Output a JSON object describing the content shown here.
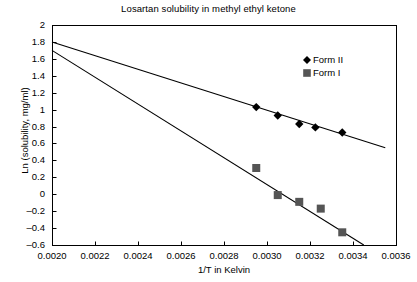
{
  "chart_data": {
    "type": "scatter",
    "title": "Losartan solubility in methyl ethyl ketone",
    "xlabel": "1/T in Kelvin",
    "ylabel": "Ln (solubility, mg/ml)",
    "xlim": [
      0.002,
      0.0036
    ],
    "ylim": [
      -0.6,
      2.0
    ],
    "xticks": [
      "0.0020",
      "0.0022",
      "0.0024",
      "0.0026",
      "0.0028",
      "0.0030",
      "0.0032",
      "0.0034",
      "0.0036"
    ],
    "xtick_values": [
      0.002,
      0.0022,
      0.0024,
      0.0026,
      0.0028,
      0.003,
      0.0032,
      0.0034,
      0.0036
    ],
    "yticks": [
      "2",
      "1.8",
      "1.6",
      "1.4",
      "1.2",
      "1",
      "0.8",
      "0.6",
      "0.4",
      "0.2",
      "0",
      "–0.2",
      "–0.4",
      "–0.6"
    ],
    "ytick_values": [
      2,
      1.8,
      1.6,
      1.4,
      1.2,
      1,
      0.8,
      0.6,
      0.4,
      0.2,
      0,
      -0.2,
      -0.4,
      -0.6
    ],
    "grid": false,
    "legend_position": "upper right",
    "series": [
      {
        "name": "Form II",
        "marker": "diamond",
        "color": "#000000",
        "x": [
          0.00295,
          0.00305,
          0.00315,
          0.003225,
          0.00335
        ],
        "y": [
          1.03,
          0.93,
          0.83,
          0.79,
          0.73
        ],
        "trendline": {
          "x": [
            0.002,
            0.00355
          ],
          "y": [
            1.8,
            0.55
          ]
        }
      },
      {
        "name": "Form I",
        "marker": "square",
        "color": "#555555",
        "x": [
          0.00295,
          0.00305,
          0.00315,
          0.00325,
          0.00335
        ],
        "y": [
          0.31,
          -0.01,
          -0.09,
          -0.17,
          -0.45
        ],
        "trendline": {
          "x": [
            0.002,
            0.00345
          ],
          "y": [
            1.7,
            -0.6
          ]
        }
      }
    ]
  },
  "legend": {
    "items": [
      {
        "label": "Form II"
      },
      {
        "label": "Form I"
      }
    ]
  }
}
